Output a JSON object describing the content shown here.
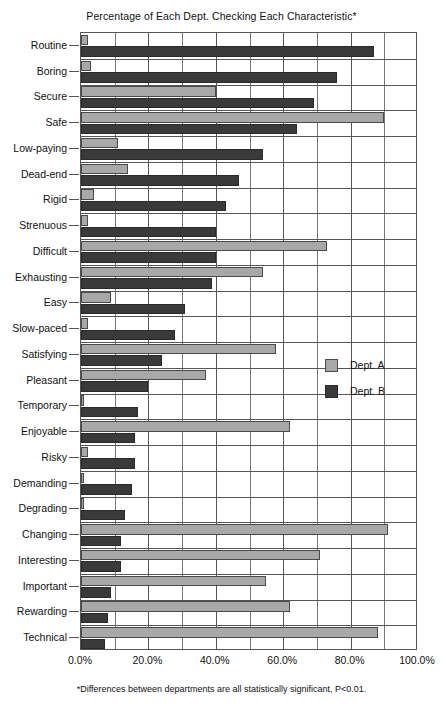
{
  "chart_data": {
    "type": "bar",
    "orientation": "horizontal",
    "title": "Percentage of Each Dept. Checking Each Characteristic*",
    "footnote": "*Differences between departments are all statistically significant, P<0.01.",
    "xlabel": "",
    "ylabel": "",
    "xlim": [
      0,
      100
    ],
    "xtick_labels": [
      "0.0%",
      "20.0%",
      "40.0%",
      "60.0%",
      "80.0%",
      "100.0%"
    ],
    "xtick_values": [
      0,
      20,
      40,
      60,
      80,
      100
    ],
    "minor_gridline_step": 10,
    "grid": true,
    "legend_position": "middle-right",
    "categories": [
      "Routine",
      "Boring",
      "Secure",
      "Safe",
      "Low-paying",
      "Dead-end",
      "Rigid",
      "Strenuous",
      "Difficult",
      "Exhausting",
      "Easy",
      "Slow-paced",
      "Satisfying",
      "Pleasant",
      "Temporary",
      "Enjoyable",
      "Risky",
      "Demanding",
      "Degrading",
      "Changing",
      "Interesting",
      "Important",
      "Rewarding",
      "Technical"
    ],
    "series": [
      {
        "name": "Dept. A",
        "color": "#a8a8a8",
        "values": [
          2,
          3,
          40,
          90,
          11,
          14,
          4,
          2,
          73,
          54,
          9,
          2,
          58,
          37,
          1,
          62,
          2,
          1,
          1,
          91,
          71,
          55,
          62,
          88
        ]
      },
      {
        "name": "Dept. B",
        "color": "#3a3a3a",
        "values": [
          87,
          76,
          69,
          64,
          54,
          47,
          43,
          40,
          40,
          39,
          31,
          28,
          24,
          20,
          17,
          16,
          16,
          15,
          13,
          12,
          12,
          9,
          8,
          7
        ]
      }
    ]
  },
  "legend": {
    "items": [
      {
        "label": "Dept. A",
        "swatch": "a"
      },
      {
        "label": "Dept. B",
        "swatch": "b"
      }
    ]
  }
}
